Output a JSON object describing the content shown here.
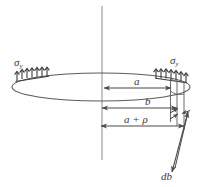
{
  "figure": {
    "type": "engineering-diagram",
    "colors": {
      "stroke": "#4a4a4a",
      "stroke_light": "#7a7a7a",
      "text": "#3b3b3b",
      "background": "#fefefe"
    },
    "labels": {
      "sigma_left": "σ",
      "sigma_left_sub": "y",
      "sigma_right": "σ",
      "sigma_right_sub": "y",
      "dim_a": "a",
      "dim_b": "b",
      "dim_a_plus_rho": "a + ρ",
      "element_db": "db"
    },
    "geometry": {
      "axis_label": "vertical-centerline",
      "ellipse_label": "plate-disc-outline",
      "axis_x": 102,
      "axis_y_top": 6,
      "axis_y_bottom": 160,
      "ellipse_cx": 101,
      "ellipse_cy": 87,
      "ellipse_rx": 89,
      "ellipse_ry": 14,
      "dim_a_y": 88,
      "dim_a_x1": 104,
      "dim_a_x2": 171,
      "dim_b_y": 108,
      "dim_b_x1": 102,
      "dim_b_x2": 177,
      "dim_arho_y": 126,
      "dim_arho_x1": 101,
      "dim_arho_x2": 184,
      "hatch_count_left": 6,
      "hatch_count_right": 7
    }
  }
}
